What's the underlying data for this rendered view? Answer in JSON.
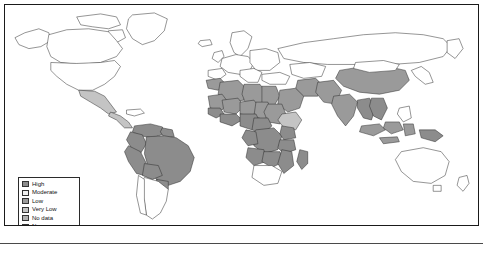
{
  "map": {
    "title": "World choropleth map",
    "projection": "equirectangular",
    "background_color": "#ffffff",
    "border_color": "#1a1a1a",
    "country_outline_color": "#2b2b2b",
    "legend": {
      "position": "bottom-left",
      "items": [
        {
          "label": "High",
          "color": "#8c8c8c"
        },
        {
          "label": "Moderate",
          "color": "#f2f2f2"
        },
        {
          "label": "Low",
          "color": "#9a9a9a"
        },
        {
          "label": "Very Low",
          "color": "#c4c4c4"
        },
        {
          "label": "No data",
          "color": "#b0b0b0"
        },
        {
          "label": "None",
          "color": "#ffffff"
        }
      ]
    },
    "classified_regions": [
      {
        "region": "Brazil",
        "class": "High"
      },
      {
        "region": "Peru",
        "class": "High"
      },
      {
        "region": "Bolivia",
        "class": "High"
      },
      {
        "region": "Colombia",
        "class": "High"
      },
      {
        "region": "Venezuela",
        "class": "High"
      },
      {
        "region": "Guyana",
        "class": "High"
      },
      {
        "region": "Suriname",
        "class": "High"
      },
      {
        "region": "Ecuador",
        "class": "High"
      },
      {
        "region": "Paraguay",
        "class": "High"
      },
      {
        "region": "Nigeria",
        "class": "High"
      },
      {
        "region": "Ghana",
        "class": "High"
      },
      {
        "region": "Cote d'Ivoire",
        "class": "High"
      },
      {
        "region": "Cameroon",
        "class": "High"
      },
      {
        "region": "Democratic Republic of the Congo",
        "class": "High"
      },
      {
        "region": "Congo",
        "class": "High"
      },
      {
        "region": "Gabon",
        "class": "High"
      },
      {
        "region": "Central African Republic",
        "class": "High"
      },
      {
        "region": "Uganda",
        "class": "High"
      },
      {
        "region": "Tanzania",
        "class": "High"
      },
      {
        "region": "Mozambique",
        "class": "High"
      },
      {
        "region": "Zambia",
        "class": "High"
      },
      {
        "region": "Angola",
        "class": "High"
      },
      {
        "region": "Madagascar",
        "class": "High"
      },
      {
        "region": "Papua New Guinea",
        "class": "High"
      },
      {
        "region": "Laos",
        "class": "High"
      },
      {
        "region": "Cambodia",
        "class": "High"
      },
      {
        "region": "Myanmar",
        "class": "High"
      },
      {
        "region": "India",
        "class": "Low"
      },
      {
        "region": "China",
        "class": "Low"
      },
      {
        "region": "Indonesia",
        "class": "Low"
      },
      {
        "region": "Sudan",
        "class": "Low"
      },
      {
        "region": "Chad",
        "class": "Low"
      },
      {
        "region": "Niger",
        "class": "Low"
      },
      {
        "region": "Mali",
        "class": "Low"
      },
      {
        "region": "Mauritania",
        "class": "Low"
      },
      {
        "region": "Algeria",
        "class": "Low"
      },
      {
        "region": "Libya",
        "class": "Low"
      },
      {
        "region": "Egypt",
        "class": "Low"
      },
      {
        "region": "Saudi Arabia",
        "class": "Low"
      },
      {
        "region": "Iran",
        "class": "Low"
      },
      {
        "region": "Afghanistan",
        "class": "Low"
      },
      {
        "region": "Pakistan",
        "class": "Low"
      },
      {
        "region": "Mexico",
        "class": "Very Low"
      },
      {
        "region": "Argentina",
        "class": "None"
      },
      {
        "region": "Chile",
        "class": "None"
      },
      {
        "region": "United States",
        "class": "None"
      },
      {
        "region": "Canada",
        "class": "None"
      },
      {
        "region": "Russia",
        "class": "None"
      },
      {
        "region": "Australia",
        "class": "None"
      },
      {
        "region": "Greenland",
        "class": "None"
      }
    ]
  }
}
